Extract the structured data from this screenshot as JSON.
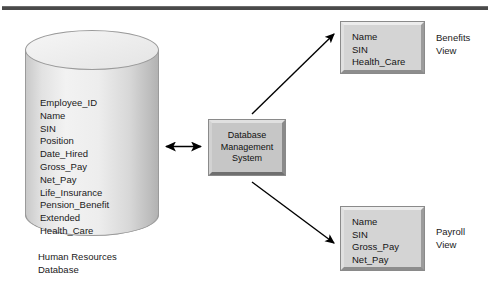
{
  "diagram": {
    "colors": {
      "rule": "#4a4a4a",
      "box_face": "#c6c6c6",
      "view_face": "#d4d4d4",
      "cylinder_light": "#f2f2f2",
      "cylinder_shadow": "#b2b2b2",
      "text": "#1a1a1a",
      "arrow": "#000000"
    },
    "database": {
      "name": "Human Resources Database",
      "caption_lines": [
        "Human Resources",
        "Database"
      ],
      "fields": [
        "Employee_ID",
        "Name",
        "SIN",
        "Position",
        "Date_Hired",
        "Gross_Pay",
        "Net_Pay",
        "Life_Insurance",
        "Pension_Benefit",
        "Extended",
        "Health_Care"
      ]
    },
    "dbms": {
      "lines": [
        "Database",
        "Management",
        "System"
      ]
    },
    "views": [
      {
        "id": "benefits",
        "label_lines": [
          "Benefits",
          "View"
        ],
        "fields": [
          "Name",
          "SIN",
          "Health_Care"
        ]
      },
      {
        "id": "payroll",
        "label_lines": [
          "Payroll",
          "View"
        ],
        "fields": [
          "Name",
          "SIN",
          "Gross_Pay",
          "Net_Pay"
        ]
      }
    ],
    "connectors": [
      {
        "id": "db-to-dbms",
        "type": "double-arrow",
        "from": "database",
        "to": "dbms"
      },
      {
        "id": "dbms-to-benefits",
        "type": "arrow",
        "from": "dbms",
        "to": "benefits"
      },
      {
        "id": "dbms-to-payroll",
        "type": "arrow",
        "from": "dbms",
        "to": "payroll"
      }
    ]
  }
}
